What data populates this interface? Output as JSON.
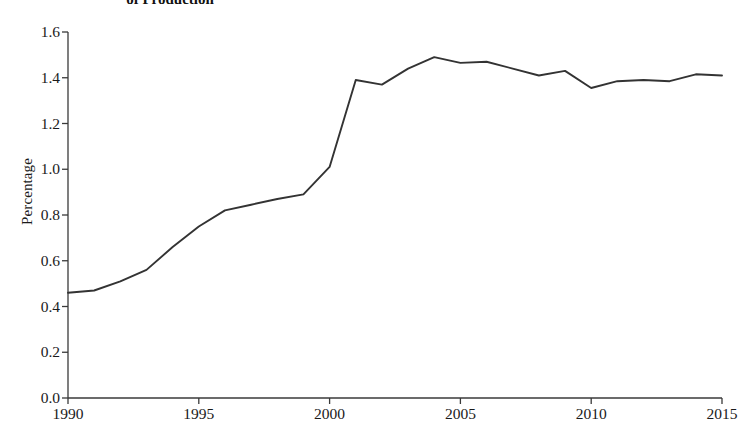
{
  "chart_data": {
    "type": "line",
    "title": "of Production",
    "xlabel": "",
    "ylabel": "Percentage",
    "xlim": [
      1990,
      2015
    ],
    "ylim": [
      0.0,
      1.6
    ],
    "grid": false,
    "legend": null,
    "line_color": "#333333",
    "x": [
      1990,
      1991,
      1992,
      1993,
      1994,
      1995,
      1996,
      1997,
      1998,
      1999,
      2000,
      2001,
      2002,
      2003,
      2004,
      2005,
      2006,
      2007,
      2008,
      2009,
      2010,
      2011,
      2012,
      2013,
      2014,
      2015
    ],
    "series": [
      {
        "name": "Percentage of Production",
        "values": [
          0.46,
          0.47,
          0.51,
          0.56,
          0.66,
          0.75,
          0.82,
          0.845,
          0.87,
          0.89,
          1.01,
          1.39,
          1.37,
          1.44,
          1.49,
          1.465,
          1.47,
          1.44,
          1.41,
          1.43,
          1.355,
          1.385,
          1.39,
          1.385,
          1.415,
          1.41
        ]
      }
    ],
    "ytick_values": [
      0.0,
      0.2,
      0.4,
      0.6,
      0.8,
      1.0,
      1.2,
      1.4,
      1.6
    ],
    "ytick_labels": [
      "0.0",
      "0.2",
      "0.4",
      "0.6",
      "0.8",
      "1.0",
      "1.2",
      "1.4",
      "1.6"
    ],
    "xtick_values": [
      1990,
      1995,
      2000,
      2005,
      2010,
      2015
    ],
    "xtick_labels": [
      "1990",
      "1995",
      "2000",
      "2005",
      "2010",
      "2015"
    ]
  }
}
